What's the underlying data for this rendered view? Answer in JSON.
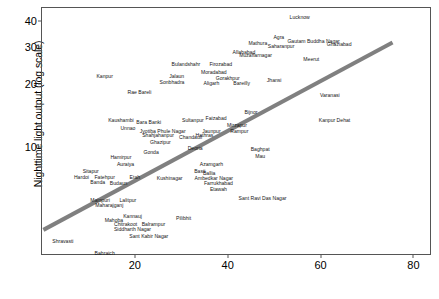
{
  "chart_data": {
    "type": "scatter",
    "title": "",
    "subtitle": "",
    "xlabel": "",
    "ylabel": "Nighttime light output (log scale)",
    "xlim": [
      0,
      84
    ],
    "ylim": [
      3.0,
      46
    ],
    "yscale": "log",
    "xticks": [
      20,
      40,
      60,
      80
    ],
    "yticks": [
      10,
      20,
      30,
      40
    ],
    "grid": false,
    "legend": null,
    "marker_style": "text-label",
    "trendline": {
      "type": "linear-fit",
      "color": "#808080",
      "width_px": 4,
      "x_start": 0.3,
      "y_start": 4.0,
      "x_end": 75.5,
      "y_end": 31.5
    },
    "points": [
      {
        "label": "Lucknow",
        "x": 55.5,
        "y": 41.0
      },
      {
        "label": "Agra",
        "x": 51.0,
        "y": 33.0
      },
      {
        "label": "Gautam Buddha Nagar",
        "x": 58.5,
        "y": 31.5
      },
      {
        "label": "Mathura",
        "x": 46.5,
        "y": 31.0
      },
      {
        "label": "Saharanpur",
        "x": 51.5,
        "y": 30.0
      },
      {
        "label": "Ghaziabad",
        "x": 64.0,
        "y": 30.5
      },
      {
        "label": "Allahabad",
        "x": 43.5,
        "y": 28.0
      },
      {
        "label": "Muzaffarnagar",
        "x": 46.0,
        "y": 27.0
      },
      {
        "label": "Meerut",
        "x": 58.0,
        "y": 26.0
      },
      {
        "label": "Bulandshahr",
        "x": 31.0,
        "y": 24.5
      },
      {
        "label": "Firozabad",
        "x": 38.5,
        "y": 24.5
      },
      {
        "label": "Moradabad",
        "x": 37.0,
        "y": 22.5
      },
      {
        "label": "Jalaun",
        "x": 29.0,
        "y": 21.5
      },
      {
        "label": "Gorakhpur",
        "x": 40.0,
        "y": 21.0
      },
      {
        "label": "Sonbhadra",
        "x": 28.0,
        "y": 20.2
      },
      {
        "label": "Aligarh",
        "x": 36.5,
        "y": 20.0
      },
      {
        "label": "Rae Bareli",
        "x": 21.0,
        "y": 18.0
      },
      {
        "label": "Bareilly",
        "x": 43.0,
        "y": 20.0
      },
      {
        "label": "Jhansi",
        "x": 50.0,
        "y": 20.5
      },
      {
        "label": "Kanpur",
        "x": 13.5,
        "y": 21.5
      },
      {
        "label": "Varanasi",
        "x": 62.0,
        "y": 17.5
      },
      {
        "label": "Bijnor",
        "x": 45.0,
        "y": 14.5
      },
      {
        "label": "Sultanpur",
        "x": 32.5,
        "y": 13.2
      },
      {
        "label": "Faizabad",
        "x": 37.5,
        "y": 13.5
      },
      {
        "label": "Mirzapur",
        "x": 42.0,
        "y": 12.5
      },
      {
        "label": "Kanpur Dehat",
        "x": 63.0,
        "y": 13.2
      },
      {
        "label": "Kaushambi",
        "x": 17.0,
        "y": 13.2
      },
      {
        "label": "Bara Banki",
        "x": 23.0,
        "y": 13.0
      },
      {
        "label": "Unnao",
        "x": 18.5,
        "y": 12.2
      },
      {
        "label": "Jyotiba Phule Nagar",
        "x": 26.0,
        "y": 11.8
      },
      {
        "label": "Rampur",
        "x": 42.5,
        "y": 11.8
      },
      {
        "label": "Shahjahanpur",
        "x": 25.0,
        "y": 11.2
      },
      {
        "label": "Jaunpur",
        "x": 36.5,
        "y": 11.8
      },
      {
        "label": "Hathras",
        "x": 35.0,
        "y": 11.2
      },
      {
        "label": "Chandauli",
        "x": 32.0,
        "y": 11.0
      },
      {
        "label": "Ghazipur",
        "x": 25.5,
        "y": 10.4
      },
      {
        "label": "Deoria",
        "x": 33.0,
        "y": 9.7
      },
      {
        "label": "Baghpat",
        "x": 47.0,
        "y": 9.6
      },
      {
        "label": "Mau",
        "x": 47.0,
        "y": 8.9
      },
      {
        "label": "Gonda",
        "x": 23.5,
        "y": 9.3
      },
      {
        "label": "Hamirpur",
        "x": 17.0,
        "y": 8.8
      },
      {
        "label": "Auraiya",
        "x": 18.0,
        "y": 8.2
      },
      {
        "label": "Azamgarh",
        "x": 36.5,
        "y": 8.2
      },
      {
        "label": "Sitapur",
        "x": 10.5,
        "y": 7.6
      },
      {
        "label": "Basti",
        "x": 34.0,
        "y": 7.6
      },
      {
        "label": "Ballia",
        "x": 36.0,
        "y": 7.4
      },
      {
        "label": "Hardoi",
        "x": 8.5,
        "y": 7.1
      },
      {
        "label": "Fatehpur",
        "x": 13.5,
        "y": 7.1
      },
      {
        "label": "Etah",
        "x": 20.0,
        "y": 7.1
      },
      {
        "label": "Kushinagar",
        "x": 27.5,
        "y": 7.0
      },
      {
        "label": "Ambedkar Nagar",
        "x": 37.0,
        "y": 7.0
      },
      {
        "label": "Banda",
        "x": 12.0,
        "y": 6.7
      },
      {
        "label": "Budaun",
        "x": 16.5,
        "y": 6.6
      },
      {
        "label": "Farrukhabad",
        "x": 38.0,
        "y": 6.6
      },
      {
        "label": "Etawah",
        "x": 38.0,
        "y": 6.2
      },
      {
        "label": "Mainpuri",
        "x": 12.5,
        "y": 5.5
      },
      {
        "label": "Lalitpur",
        "x": 18.5,
        "y": 5.5
      },
      {
        "label": "Maharajganj",
        "x": 14.5,
        "y": 5.2
      },
      {
        "label": "Sant Ravi Das Nagar",
        "x": 47.5,
        "y": 5.6
      },
      {
        "label": "Kannauj",
        "x": 19.5,
        "y": 4.6
      },
      {
        "label": "Mahoba",
        "x": 15.5,
        "y": 4.4
      },
      {
        "label": "Chitrakoot",
        "x": 18.0,
        "y": 4.2
      },
      {
        "label": "Balrampur",
        "x": 24.0,
        "y": 4.2
      },
      {
        "label": "Pilibhit",
        "x": 30.5,
        "y": 4.5
      },
      {
        "label": "Siddharth Nagar",
        "x": 19.5,
        "y": 4.0
      },
      {
        "label": "Sant Kabir Nagar",
        "x": 23.0,
        "y": 3.7
      },
      {
        "label": "Shravasti",
        "x": 4.5,
        "y": 3.5
      },
      {
        "label": "Bahraich",
        "x": 13.5,
        "y": 3.05
      }
    ]
  },
  "axes": {
    "y_title": "Nighttime light output (log scale)",
    "y_tick_labels": [
      "10",
      "20",
      "30",
      "40"
    ],
    "x_tick_labels": [
      "20",
      "40",
      "60",
      "80"
    ]
  },
  "colors": {
    "trendline": "#808080",
    "frame": "#555555",
    "text": "#141414",
    "background": "#ffffff"
  }
}
